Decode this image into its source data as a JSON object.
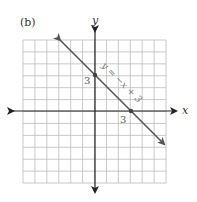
{
  "figure": {
    "panel_label": "(b)",
    "x_axis_label": "x",
    "y_axis_label": "y",
    "equation_label": "y = −x + 3",
    "intercept_labels": {
      "y_intercept": "3",
      "x_intercept": "3"
    },
    "colors": {
      "grid": "#bbbbbb",
      "axes": "#222222",
      "line": "#555555",
      "labels": "#555555"
    }
  },
  "chart_data": {
    "type": "line",
    "title": "(b)",
    "xlabel": "x",
    "ylabel": "y",
    "xlim": [
      -6,
      6
    ],
    "ylim": [
      -6,
      6
    ],
    "grid": true,
    "grid_step": 1,
    "legend": null,
    "series": [
      {
        "name": "y = −x + 3",
        "equation": "y = -x + 3",
        "slope": -1,
        "intercept": 3,
        "x": [
          -3,
          0,
          3,
          6
        ],
        "y": [
          6,
          3,
          0,
          -3
        ],
        "arrows_both_ends": true
      }
    ],
    "marked_points": [
      {
        "x": 0,
        "y": 3,
        "label": "3"
      },
      {
        "x": 3,
        "y": 0,
        "label": "3"
      }
    ],
    "annotations": [
      {
        "text": "y = −x + 3",
        "position": "along line, above right of y-intercept",
        "rotation_deg": -45
      }
    ]
  }
}
